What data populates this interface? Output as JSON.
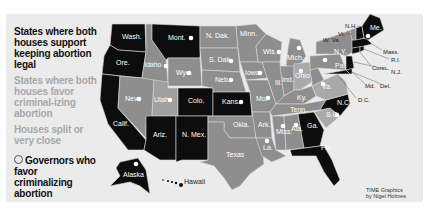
{
  "legend": {
    "legal": "States where both houses support keeping abortion legal",
    "criminalize": "States where both houses favor criminal-izing abortion",
    "split": "Houses split or very close",
    "governors": "Governors who favor criminalizing abortion"
  },
  "colors": {
    "legal": "#0d0d0d",
    "criminalize": "#8e8e8e",
    "split": "#a9a9a9",
    "background": "#ebebeb",
    "governor_dot": "#ffffff"
  },
  "states": {
    "wash": "Wash.",
    "ore": "Ore.",
    "calif": "Calif.",
    "idaho": "Idaho",
    "nev": "Nev.",
    "mont": "Mont.",
    "wyo": "Wyo.",
    "utah": "Utah",
    "colo": "Colo.",
    "ariz": "Ariz.",
    "nmex": "N. Mex.",
    "ndak": "N. Dak.",
    "sdak": "S. Dak.",
    "neb": "Neb.",
    "kans": "Kans.",
    "okla": "Okla.",
    "texas": "Texas",
    "minn": "Minn.",
    "iowa": "Iowa",
    "mo": "Mo.",
    "ark": "Ark.",
    "la": "La.",
    "wis": "Wis.",
    "ill": "Ill.",
    "mich": "Mich.",
    "ind": "Ind.",
    "ohio": "Ohio",
    "ky": "Ky.",
    "tenn": "Tenn.",
    "miss": "Miss.",
    "ala": "Ala.",
    "ga": "Ga.",
    "fla": "Fla.",
    "sc": "S.C.",
    "nc": "N.C.",
    "va": "Va.",
    "wva": "W. Va.",
    "pa": "Pa.",
    "ny": "N.Y.",
    "vt": "Vt.",
    "nh": "N.H.",
    "me": "Me.",
    "mass": "Mass.",
    "ri": "R.I.",
    "conn": "Conn.",
    "nj": "N.J.",
    "md": "Md.",
    "del": "Del.",
    "dc": "D.C.",
    "alaska": "Alaska",
    "hawaii": "Hawaii"
  },
  "governor_states": [
    "Mont.",
    "Idaho",
    "Wyo.",
    "Nev.",
    "Utah",
    "S. Dak.",
    "Neb.",
    "Kans.",
    "Iowa",
    "Mo.",
    "Wis.",
    "Mich.",
    "Ohio",
    "Pa.",
    "Va.",
    "La.",
    "Miss.",
    "Ala.",
    "S.C.",
    "Alaska",
    "N.H."
  ],
  "credit": {
    "line1": "TIME Graphics",
    "line2": "by Nigel Holmes"
  }
}
